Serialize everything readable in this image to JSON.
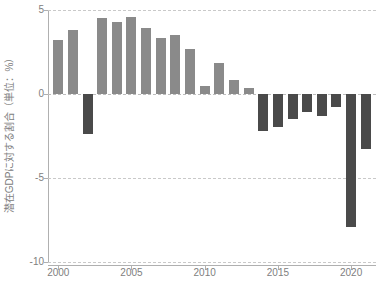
{
  "chart_data": {
    "type": "bar",
    "title": "",
    "subtitle": "",
    "xlabel": "",
    "ylabel": "潜在GDPに対する割合（単位：%）",
    "categories": [
      "2000",
      "2001",
      "2002",
      "2003",
      "2004",
      "2005",
      "2006",
      "2007",
      "2008",
      "2009",
      "2010",
      "2011",
      "2012",
      "2013",
      "2014",
      "2015",
      "2016",
      "2017",
      "2018",
      "2019",
      "2020",
      "2021"
    ],
    "values": [
      3.2,
      3.8,
      -2.4,
      4.5,
      4.3,
      4.6,
      3.9,
      3.35,
      3.5,
      2.65,
      0.5,
      1.85,
      0.85,
      0.35,
      -2.2,
      -1.95,
      -1.5,
      -1.05,
      -1.3,
      -0.75,
      -7.9,
      -3.25
    ],
    "ylim": [
      -10,
      5
    ],
    "xlim": [
      1999.3,
      2021.7
    ],
    "y_ticks": [
      5,
      0,
      -5,
      -10
    ],
    "y_tick_labels": [
      "5",
      "0",
      "-5",
      "-10"
    ],
    "x_ticks": [
      2000,
      2005,
      2010,
      2015,
      2020
    ],
    "x_tick_labels": [
      "2000",
      "2005",
      "2010",
      "2015",
      "2020"
    ],
    "grid": true,
    "grid_style": "dashed-horizontal",
    "legend": null,
    "legend_position": "none",
    "colors": {
      "positive_bar": "#8a8a8a",
      "negative_bar": "#4a4a4a",
      "gridline": "#c9c9c9",
      "axis": "#b0b0b0",
      "tick_text": "#808080",
      "background": "#ffffff"
    }
  },
  "axis": {
    "y_title": "潜在GDPに対する割合（単位：%）"
  }
}
